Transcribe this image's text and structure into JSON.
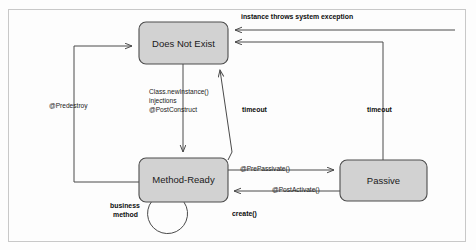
{
  "diagram": {
    "type": "state-diagram",
    "frame": {
      "x": 8,
      "y": 9,
      "width": 458,
      "height": 233,
      "border_color": "#c8c8c8"
    },
    "palette": {
      "state_fill": "#d2d2d2",
      "state_stroke": "#4d4d4d",
      "line": "#4a4a4a",
      "text": "#1a1a1a",
      "background": "#fdfdfd"
    },
    "states": [
      {
        "id": "does-not-exist",
        "label": "Does Not  Exist",
        "x": 139,
        "y": 22,
        "width": 89,
        "height": 42
      },
      {
        "id": "method-ready",
        "label": "Method-Ready",
        "x": 139,
        "y": 158,
        "width": 89,
        "height": 44
      },
      {
        "id": "passive",
        "label": "Passive",
        "x": 340,
        "y": 160,
        "width": 87,
        "height": 41
      }
    ],
    "transitions": [
      {
        "id": "system-exception",
        "label": "instance throws system exception",
        "bold": true,
        "from": "any",
        "to": "does-not-exist",
        "label_x": 241,
        "label_y": 18
      },
      {
        "id": "create",
        "label": "Class.newInstance()\ninjections\n@PostConstruct",
        "lines": [
          "Class.newInstance()",
          "injections",
          "@PostConstruct"
        ],
        "bold": false,
        "from": "does-not-exist",
        "to": "method-ready",
        "label_x": 149,
        "label_y": 97
      },
      {
        "id": "predestroy",
        "label": "@Predestroy",
        "bold": false,
        "from": "method-ready",
        "to": "does-not-exist",
        "label_x": 49,
        "label_y": 106
      },
      {
        "id": "timeout-method-ready",
        "label": "timeout",
        "bold": true,
        "from": "method-ready",
        "to": "does-not-exist",
        "label_x": 242,
        "label_y": 110
      },
      {
        "id": "timeout-passive",
        "label": "timeout",
        "bold": true,
        "from": "passive",
        "to": "does-not-exist",
        "label_x": 368,
        "label_y": 110
      },
      {
        "id": "prepassivate",
        "label": "@PrePassivate()",
        "bold": false,
        "from": "method-ready",
        "to": "passive",
        "label_x": 243,
        "label_y": 168
      },
      {
        "id": "postactivate",
        "label": "@PostActivate()",
        "bold": false,
        "from": "passive",
        "to": "method-ready",
        "label_x": 275,
        "label_y": 189
      },
      {
        "id": "business-method",
        "label": "business\nmethod",
        "lines": [
          "business",
          "method"
        ],
        "bold": true,
        "from": "method-ready",
        "to": "method-ready",
        "label_x": 124,
        "label_y": 209
      },
      {
        "id": "create-call",
        "label": "create()",
        "bold": true,
        "from": "client",
        "to": "method-ready",
        "label_x": 248,
        "label_y": 213
      }
    ]
  }
}
